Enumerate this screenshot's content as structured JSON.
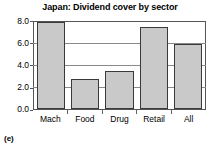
{
  "panel_label": "(e)",
  "chart_data": {
    "type": "bar",
    "title": "Japan: Dividend cover by sector",
    "xlabel": "",
    "ylabel": "",
    "categories": [
      "Mach",
      "Food",
      "Drug",
      "Retail",
      "All"
    ],
    "values": [
      8.0,
      2.75,
      3.5,
      7.5,
      6.0
    ],
    "ylim": [
      0.0,
      8.0
    ],
    "yticks": [
      "0.0",
      "2.0",
      "4.0",
      "6.0",
      "8.0"
    ],
    "ytick_values": [
      0.0,
      2.0,
      4.0,
      6.0,
      8.0
    ],
    "grid": true,
    "gridlines_at": [
      2.0,
      4.0,
      6.0
    ],
    "legend": null,
    "bar_fill_color": "#c9c9c9",
    "bar_edge_color": "#3a3a3a",
    "axis_color": "#555555",
    "grid_color": "#8a8a8a",
    "background_color": "#ffffff"
  }
}
